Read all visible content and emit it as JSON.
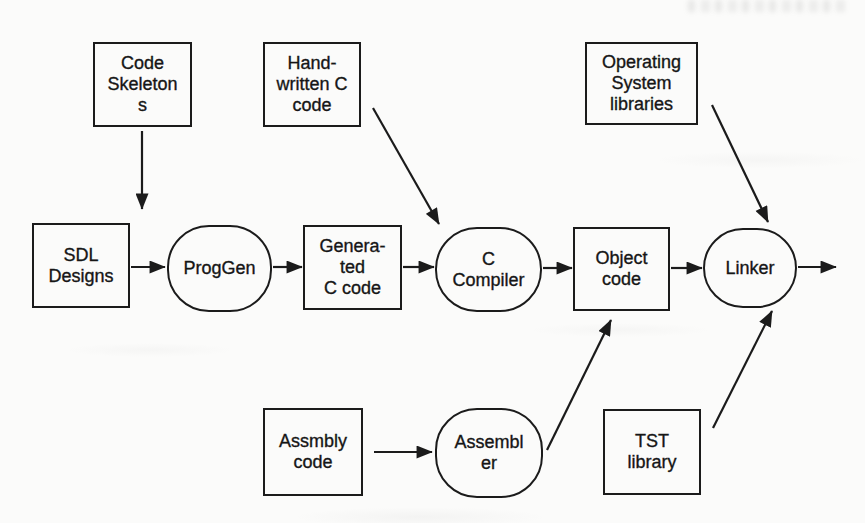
{
  "figure": {
    "type": "flowchart",
    "ink_color": "#1b1b1b",
    "paper_color": "#fbfbfa",
    "nodes": {
      "code_skeletons": {
        "label": "Code\nSkeleton\ns",
        "shape": "rect"
      },
      "hand_written_c_code": {
        "label": "Hand-\nwritten C\ncode",
        "shape": "rect"
      },
      "operating_system_libraries": {
        "label": "Operating\nSystem\nlibraries",
        "shape": "rect"
      },
      "sdl_designs": {
        "label": "SDL\nDesigns",
        "shape": "rect"
      },
      "proggen": {
        "label": "ProgGen",
        "shape": "rounded"
      },
      "generated_c_code": {
        "label": "Genera-\nted\nC code",
        "shape": "rect"
      },
      "c_compiler": {
        "label": "C\nCompiler",
        "shape": "rounded"
      },
      "object_code": {
        "label": "Object\ncode",
        "shape": "rect"
      },
      "linker": {
        "label": "Linker",
        "shape": "rounded"
      },
      "assmbly_code": {
        "label": "Assmbly\ncode",
        "shape": "rect"
      },
      "assembler": {
        "label": "Assembl\ner",
        "shape": "rounded"
      },
      "tst_library": {
        "label": "TST\nlibrary",
        "shape": "rect"
      }
    },
    "edges": [
      {
        "from": "code_skeletons",
        "to": "proggen"
      },
      {
        "from": "sdl_designs",
        "to": "proggen"
      },
      {
        "from": "proggen",
        "to": "generated_c_code"
      },
      {
        "from": "hand_written_c_code",
        "to": "c_compiler"
      },
      {
        "from": "generated_c_code",
        "to": "c_compiler"
      },
      {
        "from": "c_compiler",
        "to": "object_code"
      },
      {
        "from": "assmbly_code",
        "to": "assembler"
      },
      {
        "from": "assembler",
        "to": "object_code"
      },
      {
        "from": "object_code",
        "to": "linker"
      },
      {
        "from": "operating_system_libraries",
        "to": "linker"
      },
      {
        "from": "tst_library",
        "to": "linker"
      },
      {
        "from": "linker",
        "to": "output"
      }
    ]
  }
}
